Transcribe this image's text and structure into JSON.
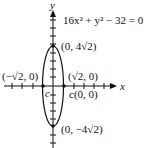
{
  "diagram": {
    "equation": "16x² + y² − 32 = 0",
    "axes": {
      "x_label": "x",
      "y_label": "y"
    },
    "points": {
      "top_vertex": "(0, 4√2)",
      "bottom_vertex": "(0, −4√2)",
      "left_point": "(−√2, 0)",
      "right_point": "(√2, 0)",
      "center": "c(0, 0)",
      "center_marker": "c"
    },
    "colors": {
      "stroke": "#111111",
      "background": "#ffffff"
    }
  }
}
